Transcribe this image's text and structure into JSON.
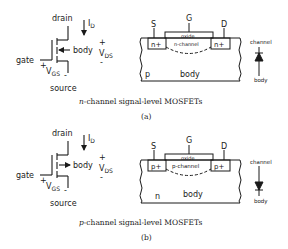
{
  "panels": [
    {
      "id": "a",
      "symbol": {
        "drain": "drain",
        "source": "source",
        "gate": "gate",
        "body": "body",
        "current": "I",
        "current_sub": "D",
        "vds": "V",
        "vds_sub": "DS",
        "vgs": "V",
        "vgs_sub": "GS",
        "plus": "+",
        "minus": "-"
      },
      "cross_section": {
        "source": "S",
        "gate": "G",
        "drain": "D",
        "oxide": "oxide",
        "left_doping": "n+",
        "right_doping": "n+",
        "channel": "n-channel",
        "substrate": "p",
        "body": "body"
      },
      "diode": {
        "top": "channel",
        "bottom": "body"
      },
      "caption_var": "n",
      "caption_rest": "-channel signal-level MOSFETs",
      "label": "(a)"
    },
    {
      "id": "b",
      "symbol": {
        "drain": "drain",
        "source": "source",
        "gate": "gate",
        "body": "body",
        "current": "I",
        "current_sub": "D",
        "vds": "V",
        "vds_sub": "DS",
        "vgs": "V",
        "vgs_sub": "GS",
        "plus": "+",
        "minus": "-"
      },
      "cross_section": {
        "source": "S",
        "gate": "G",
        "drain": "D",
        "oxide": "oxide",
        "left_doping": "p+",
        "right_doping": "p+",
        "channel": "p-channel",
        "substrate": "n",
        "body": "body"
      },
      "diode": {
        "top": "channel",
        "bottom": "body"
      },
      "caption_var": "p",
      "caption_rest": "-channel signal-level MOSFETs",
      "label": "(b)"
    }
  ]
}
